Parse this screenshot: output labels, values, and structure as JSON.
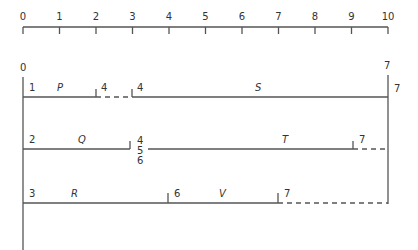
{
  "scale": {
    "ticks": [
      "0",
      "1",
      "2",
      "3",
      "4",
      "5",
      "6",
      "7",
      "8",
      "9",
      "10"
    ]
  },
  "start_node": "0",
  "end_node": "7",
  "end_node_row1": "7",
  "rows": [
    {
      "start_event": "1",
      "activities": [
        {
          "name": "P",
          "start": 0,
          "end": 2,
          "type": "solid"
        },
        {
          "name": "",
          "start": 2,
          "end": 3,
          "type": "dummy-float"
        },
        {
          "name": "S",
          "start": 3,
          "end": 10,
          "type": "solid"
        }
      ],
      "events": [
        {
          "label": "4",
          "at": 2
        },
        {
          "label": "4",
          "at": 3
        }
      ]
    },
    {
      "start_event": "2",
      "activities": [
        {
          "name": "Q",
          "start": 0,
          "end": 3,
          "type": "solid"
        },
        {
          "name": "T",
          "start": 3,
          "end": 9,
          "type": "solid"
        },
        {
          "name": "",
          "start": 9,
          "end": 10,
          "type": "dummy-float"
        }
      ],
      "events": [
        {
          "label": "4\n5\n6",
          "at": 3
        },
        {
          "label": "7",
          "at": 9
        }
      ]
    },
    {
      "start_event": "3",
      "activities": [
        {
          "name": "R",
          "start": 0,
          "end": 4,
          "type": "solid"
        },
        {
          "name": "V",
          "start": 4,
          "end": 7,
          "type": "solid"
        },
        {
          "name": "",
          "start": 7,
          "end": 10,
          "type": "dummy-float"
        }
      ],
      "events": [
        {
          "label": "6",
          "at": 4
        },
        {
          "label": "7",
          "at": 7
        }
      ]
    }
  ],
  "labels": {
    "r1_start": "1",
    "r1_act1": "P",
    "r1_ev1": "4",
    "r1_ev2": "4",
    "r1_act2": "S",
    "r1_end": "7",
    "r2_start": "2",
    "r2_act1": "Q",
    "r2_ev1a": "4",
    "r2_ev1b": "5",
    "r2_ev1c": "6",
    "r2_act2": "T",
    "r2_ev2": "7",
    "r3_start": "3",
    "r3_act1": "R",
    "r3_ev1": "6",
    "r3_act2": "V",
    "r3_ev2": "7"
  }
}
